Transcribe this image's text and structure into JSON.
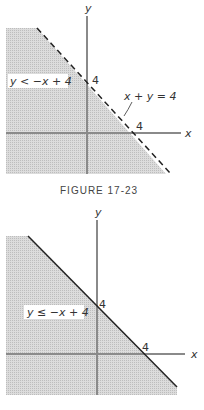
{
  "figure1": {
    "caption": "FIGURE 17-23",
    "region_label": "y < −x + 4",
    "line_label": "x + y = 4",
    "y_intercept_label": "4",
    "x_intercept_label": "4",
    "x_axis_label": "x",
    "y_axis_label": "y",
    "boundary_style": "dashed"
  },
  "figure2": {
    "region_label": "y ≤ −x + 4",
    "y_intercept_label": "4",
    "x_intercept_label": "4",
    "x_axis_label": "x",
    "y_axis_label": "y",
    "boundary_style": "solid"
  },
  "colors": {
    "shade": "#d4d4d4",
    "axis": "#8a8a8a",
    "line": "#222222"
  }
}
